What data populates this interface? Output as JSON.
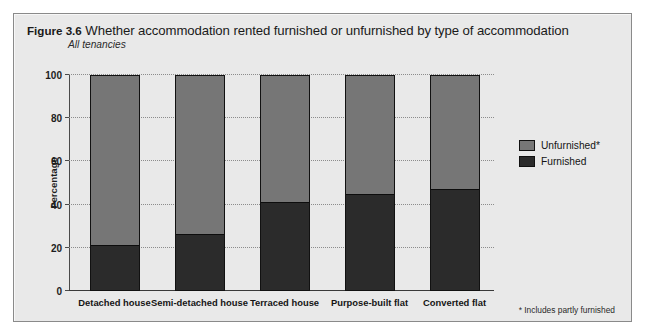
{
  "figure": {
    "number": "Figure 3.6",
    "title": "Whether accommodation rented furnished or unfurnished by type of accommodation",
    "subtitle": "All tenancies",
    "footnote": "* Includes partly furnished"
  },
  "legend": {
    "items": [
      {
        "label": "Unfurnished*",
        "color": "#767676",
        "name": "legend-unfurnished"
      },
      {
        "label": "Furnished",
        "color": "#2b2b2b",
        "name": "legend-furnished"
      }
    ]
  },
  "colors": {
    "unfurnished": "#767676",
    "furnished": "#2b2b2b",
    "panel_background": "#e9e9e9",
    "panel_border": "#8a8a8a",
    "gridline": "#8c8c8c"
  },
  "chart_data": {
    "type": "bar",
    "stacked": true,
    "stack_total": 100,
    "title": "Whether accommodation rented furnished or unfurnished by type of accommodation",
    "subtitle": "All tenancies",
    "xlabel": "",
    "ylabel": "Percentage",
    "ylim": [
      0,
      100
    ],
    "yticks": [
      0,
      20,
      40,
      60,
      80,
      100
    ],
    "ytick_labels": [
      "0",
      "20",
      "40",
      "60",
      "80",
      "100"
    ],
    "grid": true,
    "grid_axis": "y",
    "legend_position": "right",
    "categories": [
      "Detached house",
      "Semi-detached house",
      "Terraced house",
      "Purpose-built flat",
      "Converted flat"
    ],
    "series": [
      {
        "name": "Unfurnished*",
        "color": "#767676",
        "values": [
          79,
          74,
          59,
          55,
          53
        ]
      },
      {
        "name": "Furnished",
        "color": "#2b2b2b",
        "values": [
          21,
          26,
          41,
          45,
          47
        ]
      }
    ],
    "annotations": [
      "* Includes partly furnished"
    ]
  }
}
